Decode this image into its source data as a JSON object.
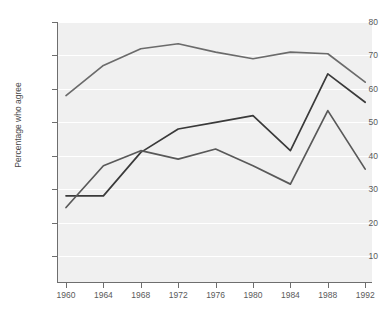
{
  "chart_data": {
    "type": "line",
    "title": "",
    "xlabel": "",
    "ylabel": "Percentage who agree",
    "categories": [
      1960,
      1964,
      1968,
      1972,
      1976,
      1980,
      1984,
      1988,
      1992
    ],
    "xtick_labels": [
      "1960",
      "1964",
      "1968",
      "1972",
      "1976",
      "1980",
      "1984",
      "1988",
      "1992"
    ],
    "ytick_labels": [
      "80",
      "70",
      "60",
      "50",
      "40",
      "30",
      "20",
      "10"
    ],
    "ytick_values": [
      80,
      70,
      60,
      50,
      40,
      30,
      20,
      10
    ],
    "xlim": [
      1958,
      1994
    ],
    "ylim": [
      4,
      80
    ],
    "grid": true,
    "legend": "none",
    "plot_background": "#f0f0f0",
    "series": [
      {
        "name": "series-1",
        "color": "#6b6b6b",
        "values": [
          58,
          67,
          72,
          73.5,
          71,
          69,
          71,
          70.5,
          62
        ]
      },
      {
        "name": "series-2",
        "color": "#3a3a3a",
        "values": [
          28,
          28,
          41,
          48,
          50,
          52,
          41.5,
          64.5,
          56
        ]
      },
      {
        "name": "series-3",
        "color": "#595959",
        "values": [
          24.5,
          37,
          41.5,
          39,
          42,
          37,
          31.5,
          53.5,
          36
        ]
      }
    ]
  }
}
